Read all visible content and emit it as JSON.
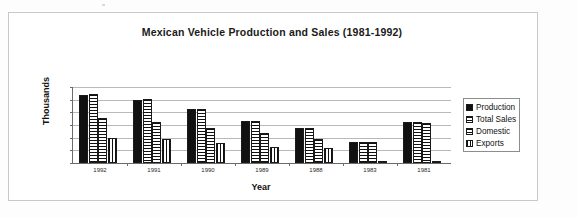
{
  "chart_data": {
    "type": "bar",
    "title": "Mexican Vehicle Production and Sales (1981-1992)",
    "xlabel": "Year",
    "ylabel": "Thousands",
    "categories": [
      "1992",
      "1991",
      "1990",
      "1989",
      "1988",
      "1983",
      "1981"
    ],
    "series": [
      {
        "name": "Production",
        "fill": "solid",
        "values": [
          1080000,
          1000000,
          850000,
          670000,
          550000,
          335000,
          650000
        ]
      },
      {
        "name": "Total Sales",
        "fill": "horizontal-lines",
        "values": [
          1085000,
          1005000,
          855000,
          670000,
          555000,
          330000,
          640000
        ]
      },
      {
        "name": "Domestic",
        "fill": "crosshatch-grid",
        "values": [
          710000,
          645000,
          560000,
          475000,
          385000,
          325000,
          630000
        ]
      },
      {
        "name": "Exports",
        "fill": "vertical-lines",
        "values": [
          395000,
          380000,
          310000,
          245000,
          230000,
          20000,
          15000
        ]
      }
    ],
    "ylim": [
      0,
      1200000
    ],
    "ytick_labels": [
      "1,200,000",
      "1,000,000",
      "800,000",
      "600,000",
      "400,000",
      "200,000",
      "0"
    ],
    "ytick_values": [
      1200000,
      1000000,
      800000,
      600000,
      400000,
      200000,
      0
    ],
    "grid": true,
    "legend_position": "right"
  },
  "legend": {
    "items": [
      {
        "label": "Production"
      },
      {
        "label": "Total Sales"
      },
      {
        "label": "Domestic"
      },
      {
        "label": "Exports"
      }
    ]
  }
}
